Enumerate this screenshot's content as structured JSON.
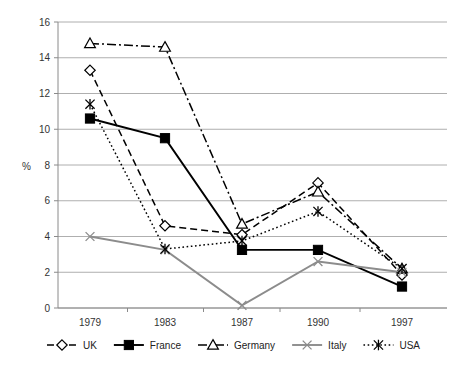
{
  "chart_data": {
    "type": "line",
    "title": "",
    "subtitle": "",
    "xlabel": "",
    "ylabel": "%",
    "categories": [
      "1979",
      "1983",
      "1987",
      "1990",
      "1997"
    ],
    "x": [
      1979,
      1983,
      1987,
      1990,
      1997
    ],
    "ylim": [
      0,
      16
    ],
    "ytick_step": 2,
    "yticks": [
      "0",
      "2",
      "4",
      "6",
      "8",
      "10",
      "12",
      "14",
      "16"
    ],
    "grid": true,
    "legend_position": "bottom",
    "series": [
      {
        "name": "UK",
        "values": [
          13.3,
          4.6,
          4.1,
          7.0,
          1.85
        ],
        "marker": "open-diamond",
        "linestyle": "dashed",
        "color": "#000000"
      },
      {
        "name": "France",
        "values": [
          10.6,
          9.5,
          3.25,
          3.25,
          1.2
        ],
        "marker": "filled-square",
        "linestyle": "solid",
        "color": "#000000"
      },
      {
        "name": "Germany",
        "values": [
          14.8,
          14.6,
          4.7,
          6.5,
          2.2
        ],
        "marker": "open-triangle",
        "linestyle": "dash-dot",
        "color": "#000000"
      },
      {
        "name": "Italy",
        "values": [
          4.0,
          3.25,
          0.15,
          2.6,
          2.0
        ],
        "marker": "x-cross",
        "linestyle": "solid",
        "color": "#8c8c8c"
      },
      {
        "name": "USA",
        "values": [
          11.4,
          3.3,
          3.75,
          5.4,
          2.2
        ],
        "marker": "asterisk",
        "linestyle": "dotted",
        "color": "#000000"
      }
    ]
  },
  "legend": {
    "items": [
      {
        "label": "UK"
      },
      {
        "label": "France"
      },
      {
        "label": "Germany"
      },
      {
        "label": "Italy"
      },
      {
        "label": "USA"
      }
    ]
  }
}
